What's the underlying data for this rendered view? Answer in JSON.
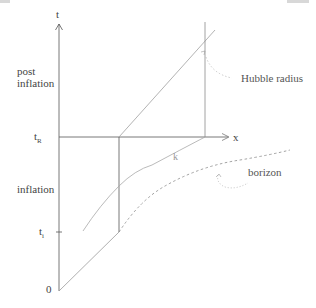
{
  "diagram": {
    "type": "spacetime diagram",
    "axes": {
      "vertical_label": "t",
      "horizontal_label": "x",
      "origin_label": "0"
    },
    "time_marks": {
      "t_R": {
        "base": "t",
        "sub": "R"
      },
      "t_i": {
        "base": "t",
        "sub": "i"
      }
    },
    "region_labels": {
      "post_inflation_line1": "post",
      "post_inflation_line2": "inflation",
      "inflation": "inflation"
    },
    "curve_labels": {
      "hubble_radius": "Hubble radius",
      "horizon": "borizon",
      "k": "k"
    },
    "colors": {
      "axis": "#555555",
      "light_line": "#a8a8a8",
      "dashed": "#8a8a8a",
      "text": "#444444"
    }
  }
}
